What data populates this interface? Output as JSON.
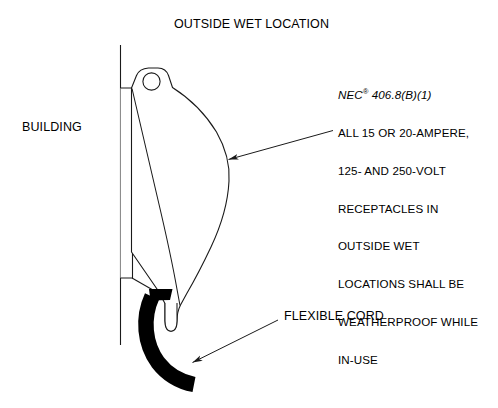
{
  "diagram": {
    "title": "OUTSIDE WET LOCATION",
    "building_label": "BUILDING",
    "flexible_cord_label": "FLEXIBLE CORD",
    "nec_callout": {
      "reference_prefix": "NEC",
      "reference_mark": "®",
      "reference_code": " 406.8(B)(1)",
      "lines": [
        "ALL 15 OR 20-AMPERE,",
        "125- AND 250-VOLT",
        "RECEPTACLES IN",
        "OUTSIDE WET",
        "LOCATIONS SHALL BE",
        "WEATHERPROOF WHILE",
        "IN-USE"
      ]
    },
    "colors": {
      "line": "#1a1a1a",
      "cord_fill": "#000000",
      "background": "#ffffff",
      "fill": "#ffffff"
    },
    "parts": {
      "wall_name": "building-wall",
      "mounting_plate_name": "receptacle-mounting-plate",
      "cover_name": "weatherproof-in-use-cover",
      "hinge_name": "cover-hinge-pivot",
      "cord_name": "flexible-cord"
    }
  }
}
